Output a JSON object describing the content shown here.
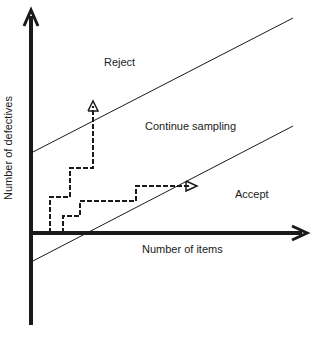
{
  "diagram": {
    "axes": {
      "x_label": "Number of items",
      "y_label": "Number of defectives"
    },
    "regions": {
      "reject": "Reject",
      "continue": "Continue sampling",
      "accept": "Accept"
    },
    "lines": [
      {
        "name": "rejection-line",
        "from": [
          31,
          153
        ],
        "to": [
          293,
          18
        ]
      },
      {
        "name": "acceptance-line",
        "from": [
          31,
          262
        ],
        "to": [
          293,
          126
        ]
      }
    ],
    "paths": [
      {
        "name": "reject-path",
        "points": [
          [
            50,
            233
          ],
          [
            50,
            197
          ],
          [
            70,
            197
          ],
          [
            70,
            168
          ],
          [
            93,
            168
          ],
          [
            93,
            104
          ]
        ],
        "outcome": "Reject"
      },
      {
        "name": "accept-path",
        "points": [
          [
            63,
            233
          ],
          [
            63,
            216
          ],
          [
            80,
            216
          ],
          [
            80,
            201
          ],
          [
            136,
            201
          ],
          [
            136,
            186
          ],
          [
            193,
            186
          ]
        ],
        "outcome": "Accept"
      }
    ],
    "colors": {
      "line": "#1a1a1a",
      "background": "#ffffff"
    }
  }
}
